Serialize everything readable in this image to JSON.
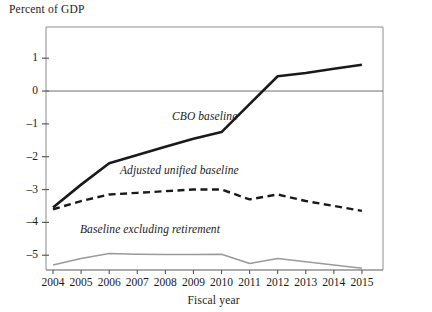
{
  "figure": {
    "yaxis_title": "Percent of GDP",
    "xaxis_label": "Fiscal year"
  },
  "chart_data": {
    "type": "line",
    "title": "",
    "subtitle": "",
    "xlabel": "Fiscal year",
    "ylabel": "Percent of GDP",
    "categories": [
      "2004",
      "2005",
      "2006",
      "2007",
      "2008",
      "2009",
      "2010",
      "2011",
      "2012",
      "2013",
      "2014",
      "2015"
    ],
    "x": [
      2004,
      2005,
      2006,
      2007,
      2008,
      2009,
      2010,
      2011,
      2012,
      2013,
      2014,
      2015
    ],
    "xlim": [
      2003.75,
      2015.75
    ],
    "ylim": [
      -5.45,
      1.95
    ],
    "yticks": [
      1,
      0,
      -1,
      -2,
      -3,
      -4,
      -5
    ],
    "ytick_labels": [
      "1",
      "0",
      "–1",
      "–2",
      "–3",
      "–4",
      "–5"
    ],
    "grid": false,
    "legend": "inline-annotations",
    "zero_line": 0,
    "series": [
      {
        "name": "CBO baseline",
        "style": "solid",
        "color": "#1a1a1a",
        "width": 2.6,
        "values": [
          -3.55,
          -2.85,
          -2.2,
          -1.95,
          -1.7,
          -1.45,
          -1.25,
          -0.4,
          0.45,
          0.55,
          0.68,
          0.8
        ]
      },
      {
        "name": "Adjusted unified baseline",
        "style": "dashed",
        "color": "#1a1a1a",
        "width": 2.4,
        "values": [
          -3.6,
          -3.35,
          -3.15,
          -3.1,
          -3.05,
          -3.0,
          -3.0,
          -3.3,
          -3.15,
          -3.35,
          -3.5,
          -3.65
        ]
      },
      {
        "name": "Baseline excluding retirement",
        "style": "solid",
        "color": "#9a9a9a",
        "width": 1.5,
        "values": [
          -5.3,
          -5.1,
          -4.95,
          -4.97,
          -4.98,
          -4.98,
          -4.97,
          -5.25,
          -5.1,
          -5.2,
          -5.3,
          -5.4
        ]
      }
    ],
    "annotations": [
      {
        "text": "CBO baseline",
        "series": "CBO baseline",
        "x_px": 172,
        "y_px": 110
      },
      {
        "text": "Adjusted unified baseline",
        "series": "Adjusted unified baseline",
        "x_px": 120,
        "y_px": 164
      },
      {
        "text": "Baseline excluding retirement",
        "series": "Baseline excluding retirement",
        "x_px": 80,
        "y_px": 223
      }
    ]
  }
}
